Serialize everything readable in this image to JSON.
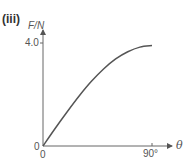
{
  "panel_label": "(iii)",
  "chart_data": {
    "type": "line",
    "title": "",
    "xlabel": "θ",
    "ylabel": "F/N",
    "x_ticks": [
      "0",
      "90°"
    ],
    "y_ticks": [
      "0",
      "4.0"
    ],
    "xlim": [
      0,
      90
    ],
    "ylim": [
      0,
      4.0
    ],
    "grid": false,
    "legend": null,
    "series": [
      {
        "name": "F vs θ",
        "x": [
          0,
          10,
          20,
          30,
          40,
          50,
          60,
          70,
          80,
          90
        ],
        "values": [
          0,
          0.68,
          1.33,
          1.95,
          2.51,
          2.99,
          3.38,
          3.66,
          3.84,
          3.9
        ]
      }
    ],
    "color": "#555555"
  },
  "labels": {
    "ylabel": "F/N",
    "ytick_max": "4.0",
    "origin_y": "0",
    "origin_x": "0",
    "xtick_max": "90°",
    "xlabel": "θ"
  }
}
